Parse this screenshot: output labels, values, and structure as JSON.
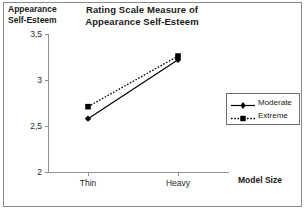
{
  "chart_data": {
    "type": "line",
    "title": "Rating Scale Measure of Appearance Self-Esteem",
    "title_line1": "Rating Scale Measure of",
    "title_line2": "Appearance Self-Esteem",
    "ylabel": "Appearance Self-Esteem",
    "ylabel_line1": "Appearance",
    "ylabel_line2": "Self-Esteem",
    "xlabel": "Model Size",
    "categories": [
      "Thin",
      "Heavy"
    ],
    "ylim": [
      2,
      3.5
    ],
    "ytick_labels": [
      "3,5",
      "3",
      "2,5",
      "2"
    ],
    "ytick_values": [
      3.5,
      3,
      2.5,
      2
    ],
    "grid": false,
    "legend_position": "right",
    "series": [
      {
        "name": "Moderate",
        "values": [
          2.58,
          3.22
        ],
        "line_style": "solid",
        "marker": "diamond",
        "color": "#000000"
      },
      {
        "name": "Extreme",
        "values": [
          2.71,
          3.26
        ],
        "line_style": "dotted",
        "marker": "square",
        "color": "#000000"
      }
    ]
  },
  "legend": {
    "items": [
      {
        "label": "Moderate"
      },
      {
        "label": "Extreme"
      }
    ]
  }
}
